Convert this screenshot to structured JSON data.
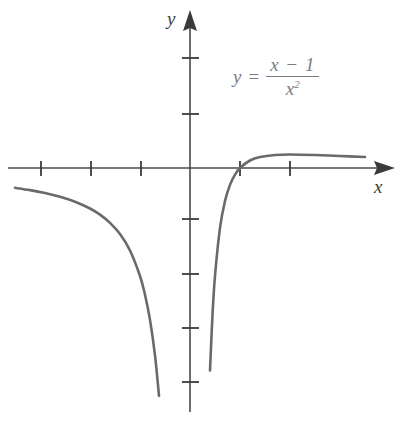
{
  "figure": {
    "title": "",
    "background_color": "#ffffff",
    "curve_color": "#6a6a6a",
    "axis_color": "#4a4a4a",
    "label_color": "#3d3d3d",
    "equation_color": "#7b7b82"
  },
  "labels": {
    "x_axis": "x",
    "y_axis": "y"
  },
  "equation": {
    "lhs": "y",
    "equals": "=",
    "numerator": "x − 1",
    "denominator_base": "x",
    "denominator_exponent": "2",
    "plain": "y = (x - 1)/x^2"
  },
  "chart_data": {
    "type": "line",
    "title": "",
    "xlabel": "x",
    "ylabel": "y",
    "function": "y = (x - 1) / x^2",
    "grid": false,
    "legend": null,
    "xlim": [
      -3.8,
      4.3
    ],
    "ylim": [
      -4.4,
      2.2
    ],
    "x_ticks": [
      -3,
      -2,
      -1,
      1,
      2
    ],
    "y_ticks": [
      -4,
      -3,
      -2,
      -1,
      1,
      2
    ],
    "asymptotes": {
      "vertical": 0,
      "horizontal": 0
    },
    "x_intercepts": [
      1
    ],
    "y_intercepts": [],
    "maximum": {
      "x": 2,
      "y": 0.25
    },
    "series": [
      {
        "name": "left-branch",
        "x": [
          -3.8,
          -3.5,
          -3.2,
          -2.9,
          -2.6,
          -2.3,
          -2.0,
          -1.8,
          -1.6,
          -1.4,
          -1.2,
          -1.0,
          -0.9,
          -0.8,
          -0.7,
          -0.62,
          -0.56,
          -0.52,
          -0.48
        ],
        "y": [
          -0.332,
          -0.367,
          -0.41,
          -0.464,
          -0.533,
          -0.624,
          -0.75,
          -0.864,
          -1.016,
          -1.224,
          -1.528,
          -2.0,
          -2.346,
          -2.813,
          -3.469,
          -4.219,
          -4.97,
          -5.62,
          -6.42
        ]
      },
      {
        "name": "right-branch",
        "x": [
          0.3,
          0.33,
          0.36,
          0.4,
          0.45,
          0.5,
          0.6,
          0.7,
          0.8,
          0.9,
          1.0,
          1.2,
          1.4,
          1.7,
          2.0,
          2.5,
          3.0,
          3.5,
          4.0,
          4.3
        ],
        "y": [
          -7.78,
          -6.15,
          -4.94,
          -3.75,
          -2.72,
          -2.0,
          -1.11,
          -0.612,
          -0.312,
          -0.123,
          0.0,
          0.139,
          0.204,
          0.242,
          0.25,
          0.24,
          0.222,
          0.204,
          0.188,
          0.178
        ]
      }
    ]
  }
}
